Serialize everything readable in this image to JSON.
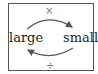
{
  "diagram": {
    "left_label": "large",
    "right_label": "small",
    "top_operator": "×",
    "bottom_operator": "÷",
    "arrows": [
      {
        "from": "large",
        "to": "small",
        "position": "top",
        "operator": "×"
      },
      {
        "from": "small",
        "to": "large",
        "position": "bottom",
        "operator": "÷"
      }
    ],
    "arrow_color": "#555555"
  }
}
